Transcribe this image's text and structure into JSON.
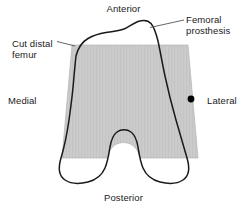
{
  "figure": {
    "orientation_labels": {
      "anterior": "Anterior",
      "posterior": "Posterior",
      "medial": "Medial",
      "lateral": "Lateral"
    },
    "callouts": [
      {
        "id": "femoral-prosthesis",
        "line1": "Femoral",
        "line2": "prosthesis",
        "text": "Femoral prosthesis"
      },
      {
        "id": "cut-distal-femur",
        "line1": "Cut distal",
        "line2": "femur",
        "text": "Cut distal femur"
      }
    ],
    "colors": {
      "bone_fill": "#c9c9c9",
      "bone_stripe": "#d2d2d2",
      "outline": "#1a1a1a",
      "background": "#ffffff",
      "marker": "#000000",
      "leader_line": "#555555",
      "text": "#1a1a1a"
    },
    "marker": {
      "name": "lateral-reference-point",
      "x": 191,
      "y": 99
    }
  }
}
